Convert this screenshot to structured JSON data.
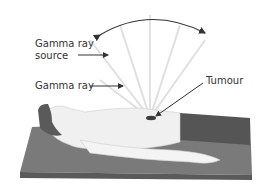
{
  "labels": {
    "source": [
      "Gamma ray",
      "source"
    ],
    "ray": "Gamma ray",
    "tumour": "Tumour"
  },
  "colors": {
    "bed_top": "#7a7a7a",
    "bed_front": "#5e5e5e",
    "body": "#f0f0f0",
    "hair": "#5a5a5a",
    "trousers": "#555555",
    "rays": "#e2e2e2",
    "arrow": "#333333",
    "tumour": "#3c3c3c"
  }
}
